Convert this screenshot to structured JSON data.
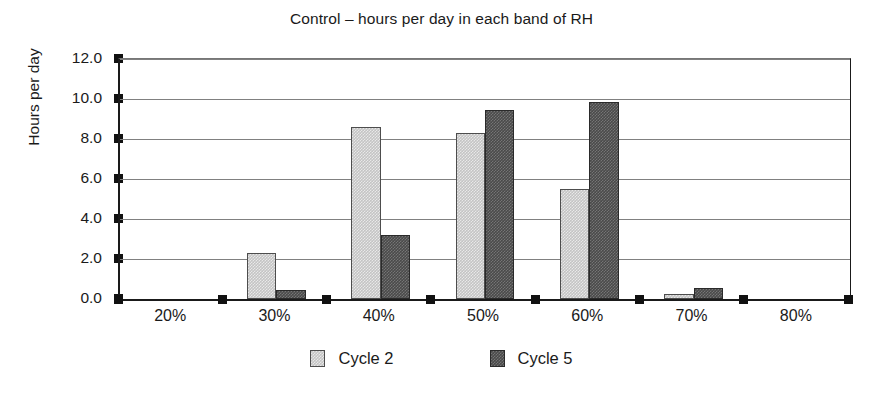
{
  "chart_data": {
    "type": "bar",
    "title": "Control – hours per day in each band of RH",
    "xlabel": "",
    "ylabel": "Hours per day",
    "categories": [
      "20%",
      "30%",
      "40%",
      "50%",
      "60%",
      "70%",
      "80%"
    ],
    "series": [
      {
        "name": "Cycle 2",
        "color": "#c4c4c4",
        "values": [
          0.0,
          2.3,
          8.6,
          8.3,
          5.5,
          0.25,
          0.0
        ]
      },
      {
        "name": "Cycle 5",
        "color": "#4a4a4a",
        "values": [
          0.0,
          0.45,
          3.2,
          9.45,
          9.85,
          0.55,
          0.0
        ]
      }
    ],
    "ylim": [
      0.0,
      12.0
    ],
    "yticks": [
      "0.0",
      "2.0",
      "4.0",
      "6.0",
      "8.0",
      "10.0",
      "12.0"
    ],
    "ytick_values": [
      0,
      2,
      4,
      6,
      8,
      10,
      12
    ],
    "grid": true,
    "legend_position": "bottom"
  },
  "legend": {
    "entries": [
      {
        "label": "Cycle 2"
      },
      {
        "label": "Cycle 5"
      }
    ]
  }
}
